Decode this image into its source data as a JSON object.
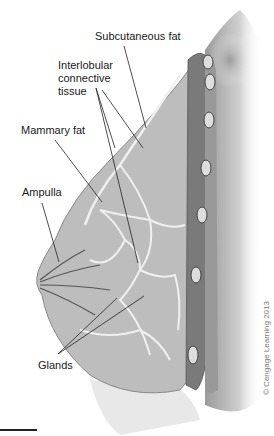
{
  "figure": {
    "labels": {
      "subcutaneous_fat": "Subcutaneous fat",
      "interlobular": "Interlobular\nconnective\ntissue",
      "mammary_fat": "Mammary fat",
      "ampulla": "Ampulla",
      "glands": "Glands"
    },
    "copyright": "© Cengage Learning 2013"
  }
}
